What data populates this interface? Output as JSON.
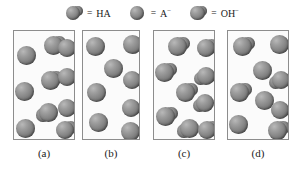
{
  "figure": {
    "type": "molecular-representation-diagram",
    "panel_count": 4
  },
  "legend": {
    "equals_sign": "=",
    "entries": [
      {
        "id": "HA",
        "label": "HA",
        "label_base": "HA",
        "superscript": "",
        "icon_name": "ha-composite-sphere-icon",
        "shape": "composite",
        "color": "#8a8a8a"
      },
      {
        "id": "A-",
        "label": "A−",
        "label_base": "A",
        "superscript": "−",
        "icon_name": "a-minus-sphere-icon",
        "shape": "single",
        "color": "#8a8a8a"
      },
      {
        "id": "OH-",
        "label": "OH−",
        "label_base": "OH",
        "superscript": "−",
        "icon_name": "oh-minus-composite-sphere-icon",
        "shape": "composite",
        "color": "#8a8a8a"
      }
    ]
  },
  "panels": [
    {
      "id": "a",
      "caption": "(a)",
      "box": {
        "left": 13,
        "top": 2,
        "width": 62,
        "height": 110
      },
      "particle_counts": {
        "single": 6,
        "composite": 4,
        "total": 10
      },
      "particles": [
        {
          "x": 30,
          "y": 5,
          "r": 9.5,
          "type": "composite",
          "lobe": "right"
        },
        {
          "x": 3,
          "y": 15,
          "r": 9.5,
          "type": "single",
          "lobe": ""
        },
        {
          "x": 44,
          "y": 8,
          "r": 9.0,
          "type": "single",
          "lobe": ""
        },
        {
          "x": 27,
          "y": 40,
          "r": 9.5,
          "type": "composite",
          "lobe": "right"
        },
        {
          "x": 1,
          "y": 51,
          "r": 9.5,
          "type": "single",
          "lobe": ""
        },
        {
          "x": 44,
          "y": 37,
          "r": 9.0,
          "type": "single",
          "lobe": ""
        },
        {
          "x": 25,
          "y": 72,
          "r": 9.5,
          "type": "composite",
          "lobe": "left"
        },
        {
          "x": 44,
          "y": 68,
          "r": 9.0,
          "type": "single",
          "lobe": ""
        },
        {
          "x": 2,
          "y": 88,
          "r": 9.5,
          "type": "single",
          "lobe": ""
        },
        {
          "x": 42,
          "y": 90,
          "r": 9.0,
          "type": "composite",
          "lobe": "right"
        }
      ]
    },
    {
      "id": "b",
      "caption": "(b)",
      "box": {
        "left": 82,
        "top": 2,
        "width": 58,
        "height": 110
      },
      "particle_counts": {
        "single": 8,
        "composite": 0,
        "total": 8
      },
      "particles": [
        {
          "x": 3,
          "y": 6,
          "r": 9.5,
          "type": "single",
          "lobe": ""
        },
        {
          "x": 40,
          "y": 4,
          "r": 9.5,
          "type": "single",
          "lobe": ""
        },
        {
          "x": 21,
          "y": 28,
          "r": 9.5,
          "type": "single",
          "lobe": ""
        },
        {
          "x": 40,
          "y": 40,
          "r": 9.0,
          "type": "single",
          "lobe": ""
        },
        {
          "x": 4,
          "y": 52,
          "r": 9.5,
          "type": "single",
          "lobe": ""
        },
        {
          "x": 39,
          "y": 68,
          "r": 9.0,
          "type": "single",
          "lobe": ""
        },
        {
          "x": 6,
          "y": 82,
          "r": 9.5,
          "type": "single",
          "lobe": ""
        },
        {
          "x": 38,
          "y": 91,
          "r": 9.5,
          "type": "single",
          "lobe": ""
        }
      ]
    },
    {
      "id": "c",
      "caption": "(c)",
      "box": {
        "left": 153,
        "top": 2,
        "width": 62,
        "height": 110
      },
      "particle_counts": {
        "single": 0,
        "composite": 9,
        "total": 9
      },
      "particles": [
        {
          "x": 14,
          "y": 6,
          "r": 9.5,
          "type": "composite",
          "lobe": "right"
        },
        {
          "x": 43,
          "y": 8,
          "r": 9.0,
          "type": "composite",
          "lobe": "right"
        },
        {
          "x": 1,
          "y": 32,
          "r": 9.5,
          "type": "composite",
          "lobe": "right"
        },
        {
          "x": 43,
          "y": 36,
          "r": 9.0,
          "type": "composite",
          "lobe": "left"
        },
        {
          "x": 22,
          "y": 52,
          "r": 9.5,
          "type": "composite",
          "lobe": "right"
        },
        {
          "x": 42,
          "y": 63,
          "r": 9.0,
          "type": "composite",
          "lobe": "left"
        },
        {
          "x": 2,
          "y": 76,
          "r": 9.5,
          "type": "composite",
          "lobe": "right"
        },
        {
          "x": 26,
          "y": 88,
          "r": 9.5,
          "type": "composite",
          "lobe": "left"
        },
        {
          "x": 44,
          "y": 90,
          "r": 9.0,
          "type": "composite",
          "lobe": "right"
        }
      ]
    },
    {
      "id": "d",
      "caption": "(d)",
      "box": {
        "left": 227,
        "top": 2,
        "width": 62,
        "height": 110
      },
      "particle_counts": {
        "single": 5,
        "composite": 4,
        "total": 9
      },
      "particles": [
        {
          "x": 5,
          "y": 6,
          "r": 9.5,
          "type": "composite",
          "lobe": "right"
        },
        {
          "x": 42,
          "y": 4,
          "r": 9.5,
          "type": "single",
          "lobe": ""
        },
        {
          "x": 25,
          "y": 30,
          "r": 9.5,
          "type": "single",
          "lobe": ""
        },
        {
          "x": 44,
          "y": 40,
          "r": 9.0,
          "type": "composite",
          "lobe": "left"
        },
        {
          "x": 2,
          "y": 52,
          "r": 9.5,
          "type": "composite",
          "lobe": "right"
        },
        {
          "x": 27,
          "y": 60,
          "r": 9.5,
          "type": "single",
          "lobe": ""
        },
        {
          "x": 1,
          "y": 84,
          "r": 9.5,
          "type": "single",
          "lobe": ""
        },
        {
          "x": 43,
          "y": 70,
          "r": 9.0,
          "type": "single",
          "lobe": ""
        },
        {
          "x": 40,
          "y": 90,
          "r": 9.5,
          "type": "composite",
          "lobe": "right"
        }
      ]
    }
  ],
  "captions": [
    {
      "text": "(a)",
      "left": 13,
      "width": 62
    },
    {
      "text": "(b)",
      "left": 82,
      "width": 58
    },
    {
      "text": "(c)",
      "left": 153,
      "width": 62
    },
    {
      "text": "(d)",
      "left": 227,
      "width": 62
    }
  ],
  "colors": {
    "sphere_mid": "#8a8a8a",
    "sphere_dark": "#5a5a5a",
    "sphere_light": "#b9b9b9",
    "panel_border": "#8d8d8d",
    "panel_fill": "#fbfbfb",
    "text": "#1b1b1b",
    "background": "#ffffff"
  }
}
